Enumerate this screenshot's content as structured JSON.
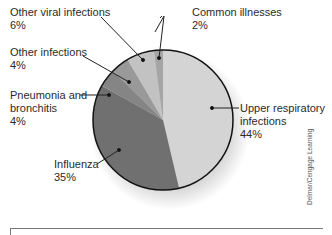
{
  "chart_data": {
    "type": "pie",
    "title": "",
    "slices": [
      {
        "label": "Upper respiratory infections",
        "value": 44,
        "color": "#d4d4d4"
      },
      {
        "label": "Influenza",
        "value": 35,
        "color": "#707070"
      },
      {
        "label": "Pneumonia and bronchitis",
        "value": 4,
        "color": "#858585"
      },
      {
        "label": "Other infections",
        "value": 4,
        "color": "#999999"
      },
      {
        "label": "Other viral infections",
        "value": 6,
        "color": "#c2c2c2"
      },
      {
        "label": "Common illnesses",
        "value": 2,
        "color": "#a5a5a5"
      }
    ],
    "start_angle_deg": 0,
    "direction": "clockwise",
    "legend": "callout labels"
  },
  "labels": {
    "other_viral": {
      "name": "Other viral infections",
      "pct": "6%"
    },
    "common": {
      "name": "Common illnesses",
      "pct": "2%"
    },
    "other_inf": {
      "name": "Other infections",
      "pct": "4%"
    },
    "pneumonia": {
      "line1": "Pneumonia and",
      "line2": "bronchitis",
      "pct": "4%"
    },
    "upper": {
      "line1": "Upper respiratory",
      "line2": "infections",
      "pct": "44%"
    },
    "influenza": {
      "name": "Influenza",
      "pct": "35%"
    }
  },
  "credit": "Delmar/Cengage Learning"
}
